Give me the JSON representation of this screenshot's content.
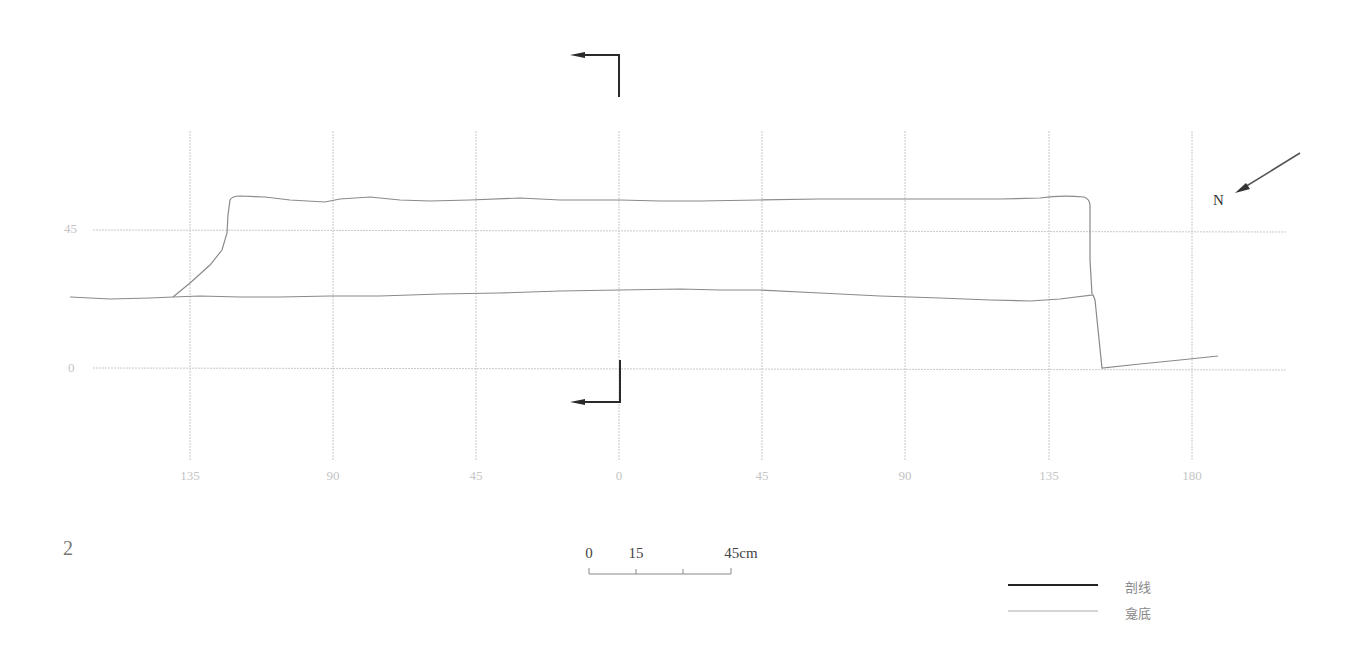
{
  "figure": {
    "number": "2",
    "north_label": "N",
    "x_axis": {
      "ticks": [
        {
          "label": "135",
          "x": 190
        },
        {
          "label": "90",
          "x": 333
        },
        {
          "label": "45",
          "x": 476
        },
        {
          "label": "0",
          "x": 619
        },
        {
          "label": "45",
          "x": 762
        },
        {
          "label": "90",
          "x": 905
        },
        {
          "label": "135",
          "x": 1049
        },
        {
          "label": "180",
          "x": 1192
        }
      ]
    },
    "y_axis": {
      "ticks": [
        {
          "label": "45",
          "y": 230
        },
        {
          "label": "0",
          "y": 368
        }
      ]
    },
    "scale_bar": {
      "labels": [
        {
          "label": "0",
          "x": 589
        },
        {
          "label": "15",
          "x": 636
        },
        {
          "label": "45cm",
          "x": 741
        }
      ]
    },
    "legend": [
      {
        "label": "剖线",
        "style": "thick-black",
        "color": "#2a2a2a"
      },
      {
        "label": "龛底",
        "style": "thin-gray",
        "color": "#aaaaaa"
      }
    ],
    "colors": {
      "grid": "#c8c8c8",
      "profile": "#8a8a8a",
      "section": "#2a2a2a"
    }
  }
}
